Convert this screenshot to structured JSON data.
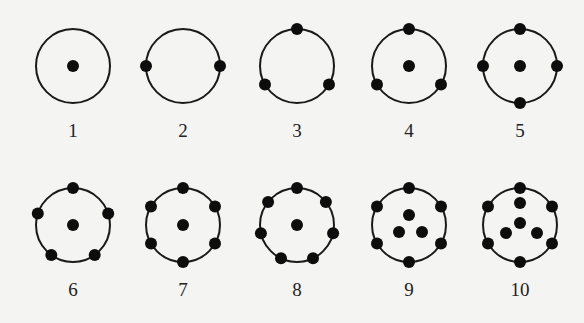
{
  "diagram": {
    "ring_radius": 37,
    "dot_radius": 6,
    "colors": {
      "ring": "#1a1a1a",
      "dot": "#0d0d0d",
      "background": "#f4f4f2"
    },
    "items": [
      {
        "label": "1",
        "cx": 73,
        "cy": 66,
        "inner": [
          [
            0,
            0
          ]
        ],
        "ring_angles": []
      },
      {
        "label": "2",
        "cx": 183,
        "cy": 66,
        "inner": [],
        "ring_angles": [
          0,
          180
        ]
      },
      {
        "label": "3",
        "cx": 297,
        "cy": 66,
        "inner": [],
        "ring_angles": [
          90,
          210,
          330
        ]
      },
      {
        "label": "4",
        "cx": 409,
        "cy": 66,
        "inner": [
          [
            0,
            0
          ]
        ],
        "ring_angles": [
          90,
          210,
          330
        ]
      },
      {
        "label": "5",
        "cx": 520,
        "cy": 66,
        "inner": [
          [
            0,
            0
          ]
        ],
        "ring_angles": [
          0,
          90,
          180,
          270
        ]
      },
      {
        "label": "6",
        "cx": 73,
        "cy": 225,
        "inner": [
          [
            0,
            0
          ]
        ],
        "ring_angles": [
          90,
          162,
          234,
          306,
          18
        ]
      },
      {
        "label": "7",
        "cx": 183,
        "cy": 225,
        "inner": [
          [
            0,
            0
          ]
        ],
        "ring_angles": [
          90,
          150,
          210,
          270,
          330,
          30
        ]
      },
      {
        "label": "8",
        "cx": 297,
        "cy": 225,
        "inner": [
          [
            0,
            0
          ]
        ],
        "ring_angles": [
          90,
          141.4,
          192.9,
          244.3,
          295.7,
          347.1,
          38.6
        ]
      },
      {
        "label": "9",
        "cx": 409,
        "cy": 225,
        "inner": [
          [
            0,
            -10
          ],
          [
            -10,
            7
          ],
          [
            13,
            7
          ]
        ],
        "ring_angles": [
          90,
          150,
          210,
          270,
          330,
          30
        ]
      },
      {
        "label": "10",
        "cx": 520,
        "cy": 225,
        "inner": [
          [
            0,
            -22
          ],
          [
            0,
            -2
          ],
          [
            -14,
            8
          ],
          [
            17,
            8
          ]
        ],
        "ring_angles": [
          90,
          150,
          210,
          270,
          330,
          30
        ]
      }
    ]
  }
}
